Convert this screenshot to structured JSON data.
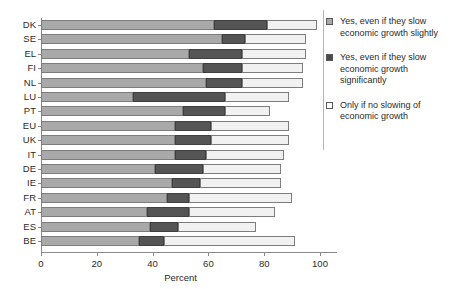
{
  "chart_data": {
    "type": "bar",
    "orientation": "horizontal",
    "stacked": true,
    "title": "",
    "xlabel": "Percent",
    "ylabel": "",
    "xlim": [
      0,
      100
    ],
    "xticks": [
      0,
      20,
      40,
      60,
      80,
      100
    ],
    "grid": false,
    "legend_position": "right",
    "categories": [
      "DK",
      "SE",
      "EL",
      "FI",
      "NL",
      "LU",
      "PT",
      "EU",
      "UK",
      "IT",
      "DE",
      "IE",
      "FR",
      "AT",
      "ES",
      "BE"
    ],
    "series": [
      {
        "name": "Yes, even if they slow economic growth slightly",
        "color": "#a9a9a9",
        "values": [
          62,
          65,
          53,
          58,
          59,
          33,
          51,
          48,
          48,
          48,
          41,
          47,
          45,
          38,
          39,
          35
        ]
      },
      {
        "name": "Yes, even if they slow economic growth significantly",
        "color": "#4a4a4a",
        "values": [
          19,
          8,
          19,
          14,
          13,
          33,
          15,
          13,
          13,
          11,
          17,
          10,
          8,
          15,
          10,
          9
        ]
      },
      {
        "name": "Only if no slowing of economic growth",
        "color": "#ffffff",
        "values": [
          18,
          22,
          23,
          22,
          22,
          23,
          16,
          28,
          28,
          28,
          28,
          29,
          37,
          31,
          28,
          47
        ]
      }
    ],
    "totals": [
      99,
      95,
      95,
      94,
      94,
      89,
      82,
      89,
      89,
      87,
      86,
      86,
      90,
      84,
      77,
      91
    ]
  },
  "legend": {
    "entries": [
      {
        "swatch": "s0",
        "label": "Yes, even if they slow economic growth slightly"
      },
      {
        "swatch": "s1",
        "label": "Yes, even if they slow economic growth significantly"
      },
      {
        "swatch": "s2",
        "label": "Only if no slowing of economic growth"
      }
    ]
  }
}
